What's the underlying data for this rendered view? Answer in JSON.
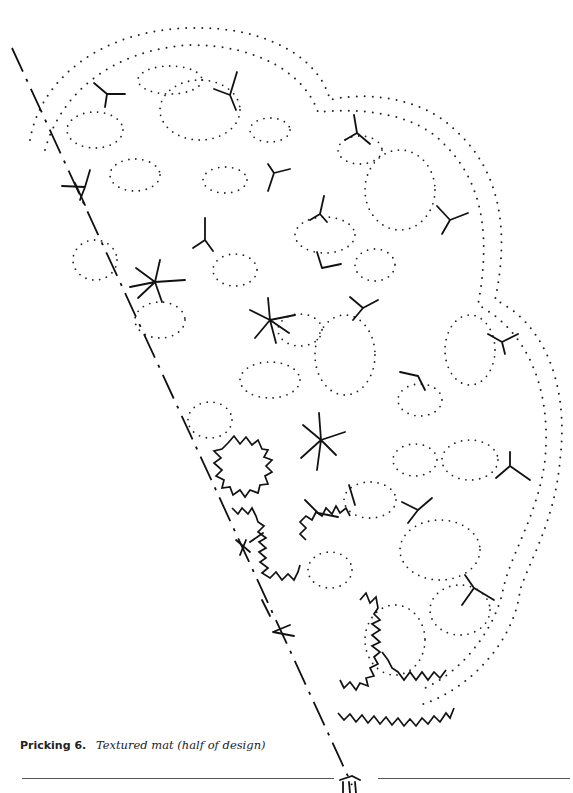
{
  "figure": {
    "label": "Pricking 6.",
    "description": "Textured mat (half of design)",
    "type": "bobbin lace pricking",
    "elements": {
      "outline": "dotted scalloped outer edge",
      "inner_shapes": "dotted oval and petal motifs",
      "ground_markers": "three-armed (Y) tally strokes",
      "stars": "six/eight-armed star motifs",
      "zigzag_motifs": "zigzag-edged flower and cross shapes along lower left",
      "axis": "long dash-dot diagonal center line"
    }
  },
  "colors": {
    "ink": "#111111",
    "paper": "#ffffff",
    "rule": "#555555"
  }
}
